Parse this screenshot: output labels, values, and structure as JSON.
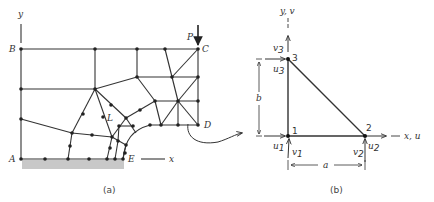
{
  "figure_a": {
    "caption": "(a)",
    "labels": {
      "y_axis": "y",
      "x_axis": "x",
      "A": "A",
      "B": "B",
      "C": "C",
      "D": "D",
      "E": "E",
      "L": "L",
      "P": "P"
    },
    "description": "Finite element mesh of a plate quadrant with a circular cutout, load P at corner C, fixed support along A–E"
  },
  "figure_b": {
    "caption": "(b)",
    "labels": {
      "y_axis": "y, v",
      "x_axis": "x, u",
      "node1": "1",
      "node2": "2",
      "node3": "3",
      "u1": "u",
      "u1_sub": "1",
      "v1": "v",
      "v1_sub": "1",
      "u2": "u",
      "u2_sub": "2",
      "v2": "v",
      "v2_sub": "2",
      "u3": "u",
      "u3_sub": "3",
      "v3": "v",
      "v3_sub": "3",
      "dim_a": "a",
      "dim_b": "b"
    },
    "description": "Triangular element with nodes 1, 2, 3 and displacement components u, v at each node"
  }
}
